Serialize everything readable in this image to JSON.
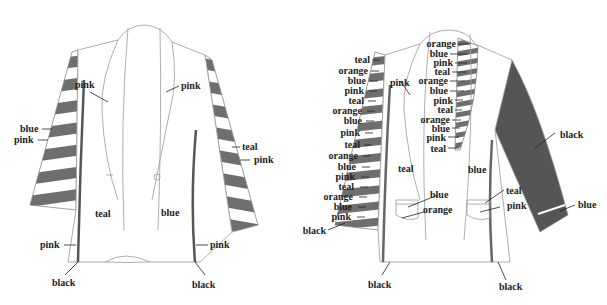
{
  "figure": {
    "colors": {
      "stripe": "#6e6e6e",
      "sleeve_dark": "#555555",
      "line": "#888888",
      "text": "#222222"
    }
  },
  "left_jacket": {
    "labels": {
      "lapel_left": "pink",
      "lapel_right": "pink",
      "sleeve_left_1": "blue",
      "sleeve_left_2": "pink",
      "sleeve_right_1": "teal",
      "sleeve_right_2": "pink",
      "body_left": "teal",
      "body_right": "blue",
      "hem_left": "pink",
      "hem_right": "pink",
      "edge_left": "black",
      "edge_right": "black"
    }
  },
  "right_jacket": {
    "sleeve_labels": [
      "teal",
      "orange",
      "blue",
      "pink",
      "teal",
      "orange",
      "blue",
      "pink",
      "teal",
      "orange",
      "blue",
      "pink",
      "teal",
      "orange",
      "blue",
      "pink",
      "black"
    ],
    "lapel_labels": [
      "orange",
      "blue",
      "pink",
      "teal",
      "orange",
      "blue",
      "pink",
      "teal",
      "orange",
      "blue",
      "pink",
      "teal"
    ],
    "labels": {
      "lapel_left": "pink",
      "body_left": "teal",
      "body_right": "blue",
      "pocket_left_1": "blue",
      "pocket_left_2": "orange",
      "pocket_right_1": "teal",
      "pocket_right_2": "pink",
      "sleeve_right": "black",
      "cuff_right": "blue",
      "edge_left": "black",
      "edge_right": "black"
    }
  }
}
